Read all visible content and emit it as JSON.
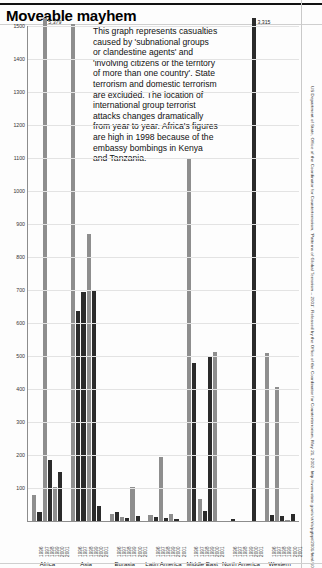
{
  "header": {
    "title": "Moveable mayhem"
  },
  "blurb": "This graph represents casualties caused by 'subnational groups or clandestine agents' and 'involving citizens or the territory of more than one country'. State terrorism and domestic terrorism are excluded. The location of international group terrorist attacks changes dramatically from year to year. Africa's figures are high in 1998 because of the embassy bombings in Kenya and Tanzania.",
  "source": "US Department of State, Office of the Coordinator for Counterterrorism, 'Patterns of Global Terrorism – 2001'. Released by the Office of the Coordinator for Counterterrorism, May 21, 2002. http://www.state.gov/s/ct/rls/pgtrpt/2001/html/10236.htm",
  "chart_data": {
    "type": "bar",
    "title": "Moveable mayhem",
    "xlabel": "",
    "ylabel": "",
    "ylim": [
      0,
      1500
    ],
    "ytick_step": 100,
    "yticks": [
      0,
      100,
      200,
      300,
      400,
      500,
      600,
      700,
      800,
      900,
      1000,
      1100,
      1200,
      1300,
      1400,
      1500
    ],
    "grid": true,
    "legend": "none",
    "clipped_note": "Two bars exceed the axis maximum and are labelled with their true value.",
    "categories": [
      "1996",
      "1997",
      "1998",
      "1999",
      "2000",
      "2001"
    ],
    "groups": [
      {
        "region": "Africa",
        "values": [
          80,
          28,
          5379,
          185,
          102,
          150
        ],
        "clipped": [
          false,
          false,
          true,
          false,
          false,
          false
        ],
        "clipped_labels": [
          "",
          "",
          "5,379",
          "",
          "",
          ""
        ],
        "shades": [
          "light",
          "dark",
          "light",
          "dark",
          "light",
          "dark"
        ]
      },
      {
        "region": "Asia",
        "values": [
          1507,
          635,
          695,
          870,
          700,
          45
        ],
        "clipped": [
          false,
          false,
          false,
          false,
          false,
          false
        ],
        "clipped_labels": [
          "",
          "",
          "",
          "",
          "",
          ""
        ],
        "shades": [
          "light",
          "dark",
          "dark",
          "light",
          "dark",
          "dark"
        ]
      },
      {
        "region": "Eurasia",
        "values": [
          20,
          27,
          12,
          8,
          103,
          15
        ],
        "clipped": [
          false,
          false,
          false,
          false,
          false,
          false
        ],
        "clipped_labels": [
          "",
          "",
          "",
          "",
          "",
          ""
        ],
        "shades": [
          "light",
          "dark",
          "light",
          "dark",
          "light",
          "dark"
        ]
      },
      {
        "region": "Latin America",
        "values": [
          18,
          11,
          195,
          9,
          20,
          6
        ],
        "clipped": [
          false,
          false,
          false,
          false,
          false,
          false
        ],
        "clipped_labels": [
          "",
          "",
          "",
          "",
          "",
          ""
        ],
        "shades": [
          "light",
          "dark",
          "light",
          "dark",
          "light",
          "dark"
        ]
      },
      {
        "region": "Middle East",
        "values": [
          1097,
          480,
          68,
          31,
          500,
          513
        ],
        "clipped": [
          false,
          false,
          false,
          false,
          false,
          false
        ],
        "clipped_labels": [
          "",
          "",
          "",
          "",
          "",
          ""
        ],
        "shades": [
          "light",
          "dark",
          "light",
          "dark",
          "dark",
          "light"
        ]
      },
      {
        "region": "North America",
        "values": [
          0,
          7,
          0,
          0,
          0,
          3315
        ],
        "clipped": [
          false,
          false,
          false,
          false,
          false,
          true
        ],
        "clipped_labels": [
          "",
          "",
          "",
          "",
          "",
          "3,315"
        ],
        "shades": [
          "light",
          "dark",
          "light",
          "dark",
          "light",
          "dark"
        ]
      },
      {
        "region": "Western Europe",
        "values": [
          510,
          17,
          405,
          16,
          4,
          20
        ],
        "clipped": [
          false,
          false,
          false,
          false,
          false,
          false
        ],
        "clipped_labels": [
          "",
          "",
          "",
          "",
          "",
          ""
        ],
        "shades": [
          "light",
          "dark",
          "light",
          "dark",
          "light",
          "dark"
        ]
      }
    ]
  }
}
